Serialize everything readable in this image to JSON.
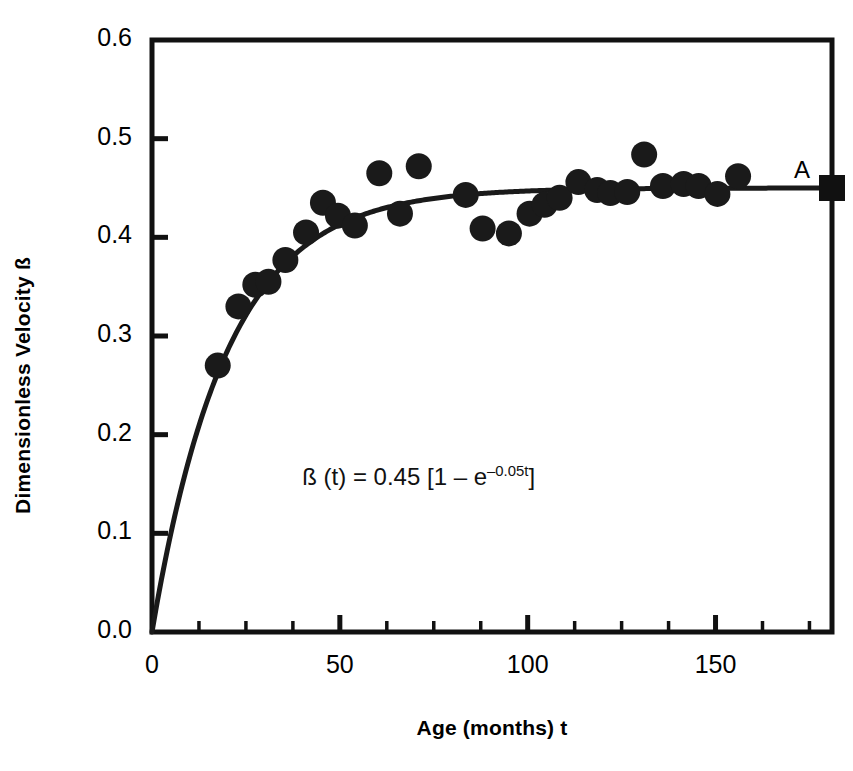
{
  "chart_data": {
    "type": "scatter",
    "title": "",
    "xlabel": "Age (months) t",
    "ylabel": "Dimensionless Velocity ß",
    "xlim": [
      0,
      181
    ],
    "ylim": [
      0.0,
      0.6
    ],
    "grid": false,
    "legend": "none",
    "x_ticks": [
      0,
      50,
      100,
      150
    ],
    "x_tick_labels": [
      "0",
      "50",
      "100",
      "150"
    ],
    "x_minor_step": 12.5,
    "y_ticks": [
      0.0,
      0.1,
      0.2,
      0.3,
      0.4,
      0.5,
      0.6
    ],
    "y_tick_labels": [
      "0.0",
      "0.1",
      "0.2",
      "0.3",
      "0.4",
      "0.5",
      "0.6"
    ],
    "marker": "filled-circle",
    "marker_color": "#1a1a1a",
    "line_color": "#1a1a1a",
    "series": [
      {
        "name": "observed",
        "type": "scatter",
        "points": [
          {
            "x": 17.5,
            "y": 0.27
          },
          {
            "x": 23.0,
            "y": 0.33
          },
          {
            "x": 27.5,
            "y": 0.352
          },
          {
            "x": 31.0,
            "y": 0.355
          },
          {
            "x": 35.5,
            "y": 0.377
          },
          {
            "x": 41.0,
            "y": 0.405
          },
          {
            "x": 45.5,
            "y": 0.435
          },
          {
            "x": 49.5,
            "y": 0.422
          },
          {
            "x": 54.0,
            "y": 0.412
          },
          {
            "x": 60.5,
            "y": 0.465
          },
          {
            "x": 66.0,
            "y": 0.424
          },
          {
            "x": 71.0,
            "y": 0.472
          },
          {
            "x": 83.5,
            "y": 0.443
          },
          {
            "x": 88.0,
            "y": 0.409
          },
          {
            "x": 95.0,
            "y": 0.404
          },
          {
            "x": 100.5,
            "y": 0.424
          },
          {
            "x": 104.5,
            "y": 0.433
          },
          {
            "x": 108.5,
            "y": 0.44
          },
          {
            "x": 113.5,
            "y": 0.456
          },
          {
            "x": 118.5,
            "y": 0.448
          },
          {
            "x": 122.0,
            "y": 0.445
          },
          {
            "x": 126.5,
            "y": 0.446
          },
          {
            "x": 131.0,
            "y": 0.484
          },
          {
            "x": 136.0,
            "y": 0.452
          },
          {
            "x": 141.5,
            "y": 0.454
          },
          {
            "x": 145.5,
            "y": 0.452
          },
          {
            "x": 150.5,
            "y": 0.444
          },
          {
            "x": 156.0,
            "y": 0.462
          }
        ]
      },
      {
        "name": "fit",
        "type": "line",
        "equation_label": "ß (t) = 0.45 [1 – e",
        "equation_exponent": "–0.05t",
        "equation_tail": "]",
        "asymptote": 0.45,
        "amplitude": 0.45,
        "rate": 0.05
      }
    ],
    "annotations": [
      {
        "name": "asymptote-marker-label",
        "text": "A",
        "x": 181,
        "y": 0.45
      },
      {
        "name": "fit-equation",
        "text": "ß (t) = 0.45 [1 – e−0.05t]",
        "x": 40,
        "y": 0.155
      }
    ]
  },
  "axes": {
    "y_title": "Dimensionless Velocity ß",
    "x_title": "Age (months) t",
    "y_labels": [
      "0.6",
      "0.5",
      "0.4",
      "0.3",
      "0.2",
      "0.1",
      "0.0"
    ],
    "x_labels": [
      "0",
      "50",
      "100",
      "150"
    ]
  },
  "annotation": {
    "equation_lead": "ß (t) = 0.45 [1 – e",
    "equation_sup": "–0.05t",
    "equation_end": "]",
    "asymptote_letter": "A"
  }
}
